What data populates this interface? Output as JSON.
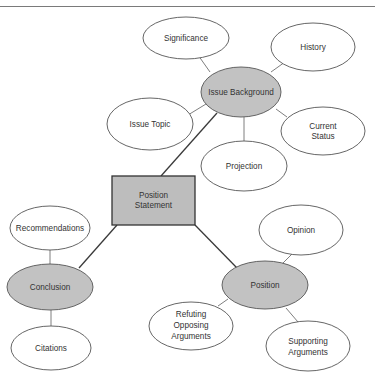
{
  "diagram": {
    "type": "concept-map",
    "colors": {
      "primary_fill": "#c2c2c2",
      "secondary_fill": "#ffffff",
      "center_fill": "#bdbdbd",
      "stroke": "#555555"
    },
    "center": {
      "label_line1": "Position",
      "label_line2": "Statement"
    },
    "hubs": {
      "issue_background": {
        "label": "Issue Background"
      },
      "conclusion": {
        "label": "Conclusion"
      },
      "position": {
        "label": "Position"
      }
    },
    "leaves": {
      "significance": {
        "label": "Significance"
      },
      "history": {
        "label": "History"
      },
      "issue_topic": {
        "label": "Issue Topic"
      },
      "current_status": {
        "label_line1": "Current",
        "label_line2": "Status"
      },
      "projection": {
        "label": "Projection"
      },
      "recommendations": {
        "label": "Recommendations"
      },
      "citations": {
        "label": "Citations"
      },
      "opinion": {
        "label": "Opinion"
      },
      "refuting": {
        "label_line1": "Refuting",
        "label_line2": "Opposing",
        "label_line3": "Arguments"
      },
      "supporting": {
        "label_line1": "Supporting",
        "label_line2": "Arguments"
      }
    },
    "edges": [
      [
        "Position Statement",
        "Issue Background"
      ],
      [
        "Position Statement",
        "Conclusion"
      ],
      [
        "Position Statement",
        "Position"
      ],
      [
        "Issue Background",
        "Significance"
      ],
      [
        "Issue Background",
        "History"
      ],
      [
        "Issue Background",
        "Issue Topic"
      ],
      [
        "Issue Background",
        "Current Status"
      ],
      [
        "Issue Background",
        "Projection"
      ],
      [
        "Conclusion",
        "Recommendations"
      ],
      [
        "Conclusion",
        "Citations"
      ],
      [
        "Position",
        "Opinion"
      ],
      [
        "Position",
        "Refuting Opposing Arguments"
      ],
      [
        "Position",
        "Supporting Arguments"
      ]
    ]
  }
}
